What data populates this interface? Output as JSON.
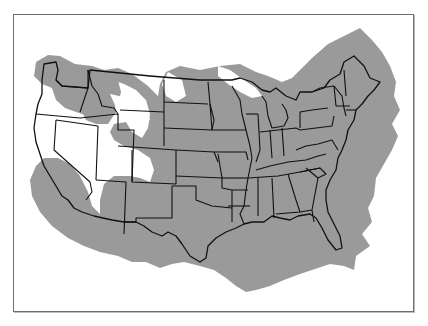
{
  "figure": {
    "type": "range-map",
    "region": "Contiguous United States",
    "colors": {
      "range_fill": "#9a9a9a",
      "background": "#ffffff",
      "state_lines": "#111111",
      "frame": "#6e6e6e"
    },
    "legend": null,
    "title": null
  },
  "map": {
    "shaded_range_description": "Gray shaded range covers most of the eastern and central US, extending north into Canada and south into Mexico/Gulf; excluded (white) areas include most of Nevada, eastern Oregon/southern Idaho band, southwestern Arizona, central Montana, northern Minnesota/Lake Superior area, and southern Texas coast and south Florida tip.",
    "features": [
      "state-boundaries",
      "range-shading",
      "frame"
    ]
  }
}
